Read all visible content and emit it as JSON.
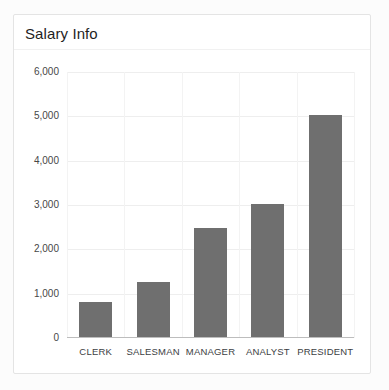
{
  "card": {
    "title": "Salary Info"
  },
  "colors": {
    "bar": "#6f6f6f",
    "h_grid": "#eeeeee",
    "v_grid": "#f3f3f3",
    "axis_line": "#bdbdbd",
    "title_text": "#1f1f1f",
    "tick_text": "#474747",
    "category_text": "#3c4043",
    "card_border": "#e4e4e4",
    "card_background": "#ffffff"
  },
  "chart_data": {
    "type": "bar",
    "title": "Salary Info",
    "categories": [
      "CLERK",
      "SALESMAN",
      "MANAGER",
      "ANALYST",
      "PRESIDENT"
    ],
    "values": [
      800,
      1250,
      2450,
      3000,
      5000
    ],
    "xlabel": "",
    "ylabel": "",
    "ylim": [
      0,
      6000
    ],
    "ytick_step": 1000,
    "ytick_labels": [
      "0",
      "1,000",
      "2,000",
      "3,000",
      "4,000",
      "5,000",
      "6,000"
    ],
    "grid": true,
    "legend": "none",
    "bar_color": "#6f6f6f",
    "bar_width_px": 33
  }
}
